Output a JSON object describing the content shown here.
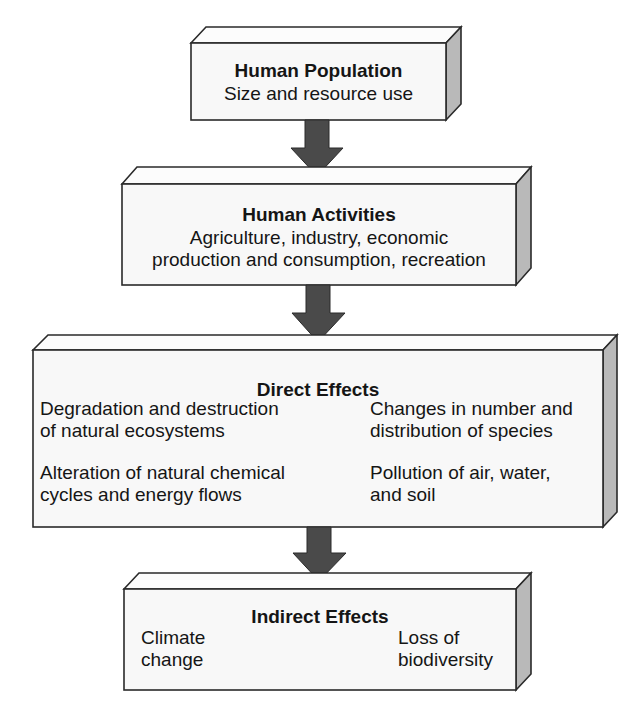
{
  "diagram": {
    "colors": {
      "front_face": "#f8f8f8",
      "top_face": "#fcfcfc",
      "side_face": "#b9b9b9",
      "arrow": "#4a4a4a",
      "outline": "#2a2a2a"
    },
    "boxes": [
      {
        "id": "human-population",
        "title": "Human Population",
        "lines": [
          "Size and resource use"
        ]
      },
      {
        "id": "human-activities",
        "title": "Human Activities",
        "lines": [
          "Agriculture, industry, economic",
          "production and consumption, recreation"
        ]
      },
      {
        "id": "direct-effects",
        "title": "Direct Effects",
        "items": [
          "Degradation and destruction\nof natural ecosystems",
          "Changes in number and\ndistribution of species",
          "Alteration of natural chemical\ncycles and energy flows",
          "Pollution of air, water,\nand soil"
        ]
      },
      {
        "id": "indirect-effects",
        "title": "Indirect Effects",
        "items": [
          "Climate\nchange",
          "Loss of\nbiodiversity"
        ]
      }
    ],
    "arrows": [
      {
        "from": "human-population",
        "to": "human-activities"
      },
      {
        "from": "human-activities",
        "to": "direct-effects"
      },
      {
        "from": "direct-effects",
        "to": "indirect-effects"
      }
    ]
  }
}
